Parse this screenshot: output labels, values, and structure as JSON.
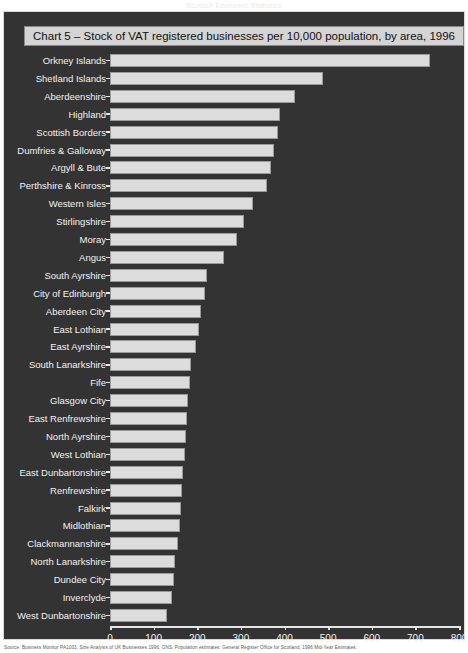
{
  "top_caption": "Scottish Economic Statistics",
  "chart": {
    "title": "Chart 5 – Stock of VAT registered businesses per 10,000 population, by area, 1996",
    "footnote": "Source: Business Monitor PA1003, Size Analysis of UK Businesses 1996, ONS. Population estimates: General Register Office for Scotland, 1996 Mid-Year Estimates."
  },
  "chart_data": {
    "type": "bar",
    "orientation": "horizontal",
    "title": "Chart 5 – Stock of VAT registered businesses per 10,000 population, by area, 1996",
    "xlabel": "",
    "ylabel": "",
    "xlim": [
      0,
      800
    ],
    "xticks": [
      0,
      100,
      200,
      300,
      400,
      500,
      600,
      700,
      800
    ],
    "grid": false,
    "legend": false,
    "bar_color": "#dcdcdc",
    "background_color": "#333333",
    "categories": [
      "Orkney Islands",
      "Shetland Islands",
      "Aberdeenshire",
      "Highland",
      "Scottish Borders",
      "Dumfries & Galloway",
      "Argyll & Bute",
      "Perthshire & Kinross",
      "Western Isles",
      "Stirlingshire",
      "Moray",
      "Angus",
      "South Ayrshire",
      "City of Edinburgh",
      "Aberdeen City",
      "East Lothian",
      "East Ayrshire",
      "South Lanarkshire",
      "Fife",
      "Glasgow City",
      "East Renfrewshire",
      "North Ayrshire",
      "West Lothian",
      "East Dunbartonshire",
      "Renfrewshire",
      "Falkirk",
      "Midlothian",
      "Clackmannanshire",
      "North Lanarkshire",
      "Dundee City",
      "Inverclyde",
      "West Dunbartonshire"
    ],
    "values": [
      734,
      489,
      424,
      390,
      386,
      375,
      368,
      360,
      327,
      308,
      291,
      262,
      223,
      217,
      208,
      203,
      197,
      186,
      183,
      178,
      177,
      174,
      172,
      168,
      165,
      162,
      160,
      157,
      148,
      147,
      142,
      131
    ]
  }
}
